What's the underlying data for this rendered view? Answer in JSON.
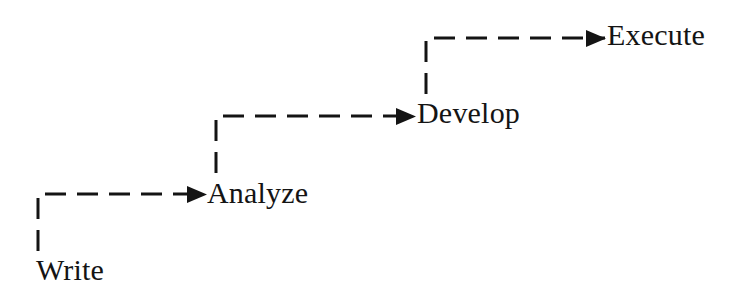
{
  "diagram": {
    "type": "staircase-process-flow",
    "title": "",
    "background_color": "#ffffff",
    "stroke_color": "#141414",
    "stroke_width": 3,
    "dash_pattern": "21 11",
    "direction": "ascending-left-to-right",
    "steps": [
      {
        "id": "write",
        "label": "Write",
        "order": 1,
        "label_x": 36,
        "label_y": 255,
        "riser_x": 38,
        "riser_top": 194,
        "riser_bottom": 251,
        "run_y": 194,
        "run_start_x": 38,
        "run_end_x": 205
      },
      {
        "id": "analyze",
        "label": "Analyze",
        "order": 2,
        "label_x": 207,
        "label_y": 178,
        "riser_x": 216,
        "riser_top": 116,
        "riser_bottom": 173,
        "run_y": 116,
        "run_start_x": 216,
        "run_end_x": 415
      },
      {
        "id": "develop",
        "label": "Develop",
        "order": 3,
        "label_x": 417,
        "label_y": 98,
        "riser_x": 426,
        "riser_top": 38,
        "riser_bottom": 94,
        "run_y": 38,
        "run_start_x": 426,
        "run_end_x": 605
      },
      {
        "id": "execute",
        "label": "Execute",
        "order": 4,
        "label_x": 607,
        "label_y": 20
      }
    ],
    "connectors": [
      {
        "id": "write-to-analyze",
        "from": "write",
        "to": "analyze",
        "style": "dashed",
        "arrowhead": "solid-triangle"
      },
      {
        "id": "analyze-to-develop",
        "from": "analyze",
        "to": "develop",
        "style": "dashed",
        "arrowhead": "solid-triangle"
      },
      {
        "id": "develop-to-execute",
        "from": "develop",
        "to": "execute",
        "style": "dashed",
        "arrowhead": "solid-triangle"
      }
    ]
  }
}
